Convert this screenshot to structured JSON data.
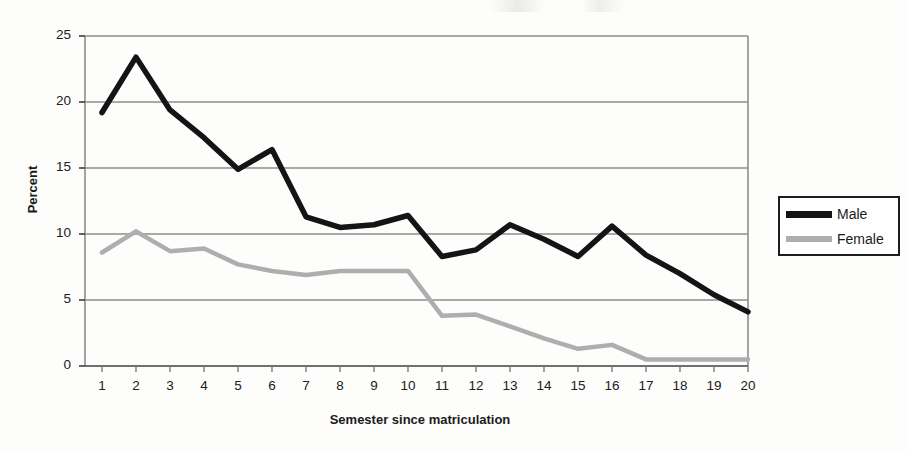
{
  "chart_data": {
    "type": "line",
    "title": "",
    "xlabel": "Semester since matriculation",
    "ylabel": "Percent",
    "x": [
      1,
      2,
      3,
      4,
      5,
      6,
      7,
      8,
      9,
      10,
      11,
      12,
      13,
      14,
      15,
      16,
      17,
      18,
      19,
      20
    ],
    "xtick_labels": [
      "1",
      "2",
      "3",
      "4",
      "5",
      "6",
      "7",
      "8",
      "9",
      "10",
      "11",
      "12",
      "13",
      "14",
      "15",
      "16",
      "17",
      "18",
      "19",
      "20"
    ],
    "ytick_labels": [
      "0",
      "5",
      "10",
      "15",
      "20",
      "25"
    ],
    "ytick_values": [
      0,
      5,
      10,
      15,
      20,
      25
    ],
    "xlim": [
      1,
      20
    ],
    "ylim": [
      0,
      25
    ],
    "grid": "horizontal",
    "legend_position": "right",
    "series": [
      {
        "name": "Male",
        "color": "#141414",
        "line_width": 5.5,
        "values": [
          19.2,
          23.4,
          19.4,
          17.3,
          14.9,
          16.4,
          11.3,
          10.5,
          10.7,
          11.4,
          8.3,
          8.8,
          10.7,
          9.6,
          8.3,
          10.6,
          8.4,
          7.0,
          5.4,
          4.1
        ]
      },
      {
        "name": "Female",
        "color": "#aeaeae",
        "line_width": 4.5,
        "values": [
          8.6,
          10.2,
          8.7,
          8.9,
          7.7,
          7.2,
          6.9,
          7.2,
          7.2,
          7.2,
          3.8,
          3.9,
          3.0,
          2.1,
          1.3,
          1.6,
          0.5,
          0.5,
          0.5,
          0.5
        ]
      }
    ]
  },
  "legend": {
    "items": [
      {
        "label": "Male"
      },
      {
        "label": "Female"
      }
    ]
  },
  "axes": {
    "y_title": "Percent",
    "x_title": "Semester since matriculation"
  }
}
